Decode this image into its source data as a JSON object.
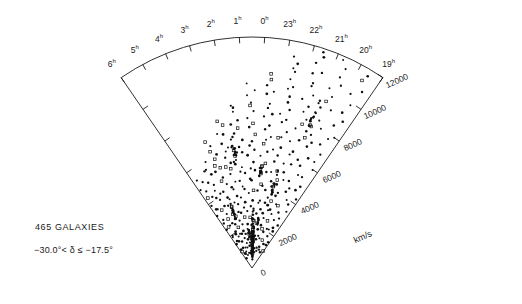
{
  "figure": {
    "kind": "redshift-cone-diagram",
    "annotations": {
      "count_label": "465 GALAXIES",
      "declination_range": "−30.0°< δ ≤ −17.5°",
      "velocity_axis_label": "km/s"
    },
    "geometry": {
      "apex_x": 252,
      "apex_y": 268,
      "radius": 231,
      "ra_start_hours": 19,
      "ra_end_hours": 30,
      "left_edge_angle_deg": 235.5,
      "right_edge_angle_deg": 304.5,
      "line_color": "#1a1a1a",
      "point_color": "#101010"
    },
    "ra_ticks": [
      {
        "label": "6",
        "unit": "h",
        "hour": 6
      },
      {
        "label": "5",
        "unit": "h",
        "hour": 5
      },
      {
        "label": "4",
        "unit": "h",
        "hour": 4
      },
      {
        "label": "3",
        "unit": "h",
        "hour": 3
      },
      {
        "label": "2",
        "unit": "h",
        "hour": 2
      },
      {
        "label": "1",
        "unit": "h",
        "hour": 1
      },
      {
        "label": "0",
        "unit": "h",
        "hour": 0
      },
      {
        "label": "23",
        "unit": "h",
        "hour": 23
      },
      {
        "label": "22",
        "unit": "h",
        "hour": 22
      },
      {
        "label": "21",
        "unit": "h",
        "hour": 21
      },
      {
        "label": "20",
        "unit": "h",
        "hour": 20
      },
      {
        "label": "19",
        "unit": "h",
        "hour": 19
      }
    ],
    "velocity_ticks": [
      {
        "label": "0",
        "value": 0
      },
      {
        "label": "2000",
        "value": 2000
      },
      {
        "label": "4000",
        "value": 4000
      },
      {
        "label": "6000",
        "value": 6000
      },
      {
        "label": "8000",
        "value": 8000
      },
      {
        "label": "10000",
        "value": 10000
      },
      {
        "label": "12000",
        "value": 12000
      }
    ]
  },
  "chart_data": {
    "type": "scatter",
    "title": "",
    "subtitle": "",
    "xlabel": "Right Ascension (hours)",
    "ylabel": "km/s",
    "projection": "polar-wedge",
    "grid": false,
    "legend": null,
    "n_points": 465,
    "r_range": [
      0,
      12000
    ],
    "theta_range_hours": [
      19,
      30
    ],
    "annotations": [
      "465 GALAXIES",
      "−30.0°< δ ≤ −17.5°"
    ],
    "points_rt": [
      [
        1120,
        19.3
      ],
      [
        1380,
        19.6
      ],
      [
        1650,
        19.4
      ],
      [
        2100,
        19.8
      ],
      [
        2460,
        19.5
      ],
      [
        2980,
        19.9
      ],
      [
        3350,
        19.45
      ],
      [
        3810,
        19.75
      ],
      [
        4180,
        19.35
      ],
      [
        4620,
        19.85
      ],
      [
        5020,
        19.55
      ],
      [
        5470,
        19.95
      ],
      [
        5910,
        19.4
      ],
      [
        6330,
        19.7
      ],
      [
        6780,
        19.5
      ],
      [
        7210,
        19.9
      ],
      [
        7660,
        19.6
      ],
      [
        8090,
        19.3
      ],
      [
        8540,
        19.8
      ],
      [
        8970,
        19.45
      ],
      [
        9410,
        19.7
      ],
      [
        9860,
        19.55
      ],
      [
        10310,
        19.85
      ],
      [
        10750,
        19.4
      ],
      [
        11180,
        19.65
      ],
      [
        11620,
        19.5
      ],
      [
        1020,
        20.2
      ],
      [
        1310,
        20.5
      ],
      [
        1720,
        20.35
      ],
      [
        2080,
        20.7
      ],
      [
        2390,
        20.15
      ],
      [
        2760,
        20.6
      ],
      [
        3140,
        20.4
      ],
      [
        3520,
        20.85
      ],
      [
        3880,
        20.25
      ],
      [
        4250,
        20.65
      ],
      [
        4610,
        20.45
      ],
      [
        5000,
        20.9
      ],
      [
        5360,
        20.3
      ],
      [
        5740,
        20.55
      ],
      [
        6110,
        20.8
      ],
      [
        6480,
        20.2
      ],
      [
        6860,
        20.6
      ],
      [
        7230,
        20.4
      ],
      [
        7600,
        20.75
      ],
      [
        7980,
        20.35
      ],
      [
        8350,
        20.55
      ],
      [
        8730,
        20.9
      ],
      [
        9100,
        20.25
      ],
      [
        9480,
        20.65
      ],
      [
        9850,
        20.45
      ],
      [
        10230,
        20.8
      ],
      [
        10600,
        20.3
      ],
      [
        10980,
        20.6
      ],
      [
        11350,
        20.5
      ],
      [
        11730,
        20.7
      ],
      [
        930,
        21.2
      ],
      [
        1250,
        21.5
      ],
      [
        1580,
        21.3
      ],
      [
        1910,
        21.7
      ],
      [
        2240,
        21.15
      ],
      [
        2570,
        21.6
      ],
      [
        2900,
        21.4
      ],
      [
        3230,
        21.8
      ],
      [
        3560,
        21.25
      ],
      [
        3890,
        21.65
      ],
      [
        4220,
        21.45
      ],
      [
        4550,
        21.9
      ],
      [
        4880,
        21.35
      ],
      [
        5210,
        21.55
      ],
      [
        5540,
        21.75
      ],
      [
        5870,
        21.2
      ],
      [
        6200,
        21.6
      ],
      [
        6530,
        21.4
      ],
      [
        6860,
        21.85
      ],
      [
        7190,
        21.3
      ],
      [
        7520,
        21.7
      ],
      [
        7850,
        21.5
      ],
      [
        8180,
        21.25
      ],
      [
        8510,
        21.65
      ],
      [
        8840,
        21.45
      ],
      [
        9170,
        21.8
      ],
      [
        9500,
        21.35
      ],
      [
        9830,
        21.6
      ],
      [
        10160,
        21.55
      ],
      [
        10490,
        21.75
      ],
      [
        10820,
        21.4
      ],
      [
        11150,
        21.7
      ],
      [
        11480,
        21.5
      ],
      [
        11810,
        21.6
      ],
      [
        880,
        22.2
      ],
      [
        1180,
        22.5
      ],
      [
        1470,
        22.3
      ],
      [
        1770,
        22.7
      ],
      [
        2060,
        22.15
      ],
      [
        2360,
        22.6
      ],
      [
        2650,
        22.4
      ],
      [
        2950,
        22.8
      ],
      [
        3240,
        22.25
      ],
      [
        3540,
        22.65
      ],
      [
        3830,
        22.45
      ],
      [
        4130,
        22.9
      ],
      [
        4420,
        22.35
      ],
      [
        4720,
        22.55
      ],
      [
        5010,
        22.75
      ],
      [
        5310,
        22.2
      ],
      [
        5600,
        22.6
      ],
      [
        5900,
        22.4
      ],
      [
        6190,
        22.85
      ],
      [
        6490,
        22.3
      ],
      [
        6780,
        22.7
      ],
      [
        7080,
        22.5
      ],
      [
        7370,
        22.25
      ],
      [
        7670,
        22.65
      ],
      [
        7960,
        22.45
      ],
      [
        8260,
        22.8
      ],
      [
        8550,
        22.35
      ],
      [
        8850,
        22.6
      ],
      [
        9140,
        22.55
      ],
      [
        9440,
        22.75
      ],
      [
        9730,
        22.4
      ],
      [
        10030,
        22.7
      ],
      [
        10320,
        22.5
      ],
      [
        10620,
        22.6
      ],
      [
        10910,
        22.45
      ],
      [
        11210,
        22.65
      ],
      [
        840,
        23.2
      ],
      [
        1120,
        23.5
      ],
      [
        1400,
        23.3
      ],
      [
        1680,
        23.7
      ],
      [
        1960,
        23.15
      ],
      [
        2240,
        23.6
      ],
      [
        2520,
        23.4
      ],
      [
        2800,
        23.8
      ],
      [
        3080,
        23.25
      ],
      [
        3360,
        23.65
      ],
      [
        3640,
        23.45
      ],
      [
        3920,
        23.9
      ],
      [
        4200,
        23.35
      ],
      [
        4480,
        23.55
      ],
      [
        4760,
        23.75
      ],
      [
        5040,
        23.2
      ],
      [
        5320,
        23.6
      ],
      [
        5600,
        23.4
      ],
      [
        5880,
        23.85
      ],
      [
        6160,
        23.3
      ],
      [
        6440,
        23.7
      ],
      [
        6720,
        23.5
      ],
      [
        7000,
        23.25
      ],
      [
        7280,
        23.65
      ],
      [
        7560,
        23.45
      ],
      [
        7840,
        23.8
      ],
      [
        8120,
        23.35
      ],
      [
        8400,
        23.6
      ],
      [
        8680,
        23.55
      ],
      [
        8960,
        23.75
      ],
      [
        9240,
        23.4
      ],
      [
        9520,
        23.7
      ],
      [
        9800,
        23.5
      ],
      [
        10080,
        23.6
      ],
      [
        800,
        24.2
      ],
      [
        1080,
        24.5
      ],
      [
        1360,
        24.3
      ],
      [
        1640,
        24.7
      ],
      [
        1920,
        24.15
      ],
      [
        2200,
        24.6
      ],
      [
        2480,
        24.4
      ],
      [
        2760,
        24.8
      ],
      [
        3040,
        24.25
      ],
      [
        3320,
        24.65
      ],
      [
        3600,
        24.45
      ],
      [
        3880,
        24.9
      ],
      [
        4160,
        24.35
      ],
      [
        4440,
        24.55
      ],
      [
        4720,
        24.75
      ],
      [
        5000,
        24.2
      ],
      [
        5280,
        24.6
      ],
      [
        5560,
        24.4
      ],
      [
        5840,
        24.85
      ],
      [
        6120,
        24.3
      ],
      [
        6400,
        24.7
      ],
      [
        6680,
        24.5
      ],
      [
        6960,
        24.25
      ],
      [
        7240,
        24.65
      ],
      [
        7520,
        24.45
      ],
      [
        7800,
        24.8
      ],
      [
        8080,
        24.35
      ],
      [
        8360,
        24.6
      ],
      [
        8640,
        24.55
      ],
      [
        8920,
        24.75
      ],
      [
        9200,
        24.4
      ],
      [
        9480,
        24.7
      ],
      [
        780,
        25.2
      ],
      [
        1050,
        25.5
      ],
      [
        1320,
        25.3
      ],
      [
        1590,
        25.7
      ],
      [
        1860,
        25.15
      ],
      [
        2130,
        25.6
      ],
      [
        2400,
        25.4
      ],
      [
        2670,
        25.8
      ],
      [
        2940,
        25.25
      ],
      [
        3210,
        25.65
      ],
      [
        3480,
        25.45
      ],
      [
        3750,
        25.9
      ],
      [
        4020,
        25.35
      ],
      [
        4290,
        25.55
      ],
      [
        4560,
        25.75
      ],
      [
        4830,
        25.2
      ],
      [
        5100,
        25.6
      ],
      [
        5370,
        25.4
      ],
      [
        5640,
        25.85
      ],
      [
        5910,
        25.3
      ],
      [
        6180,
        25.7
      ],
      [
        6450,
        25.5
      ],
      [
        6720,
        25.25
      ],
      [
        6990,
        25.65
      ],
      [
        7260,
        25.45
      ],
      [
        7530,
        25.8
      ],
      [
        7800,
        25.35
      ],
      [
        8070,
        25.6
      ],
      [
        8340,
        25.55
      ],
      [
        8610,
        25.75
      ],
      [
        760,
        26.2
      ],
      [
        1020,
        26.5
      ],
      [
        1280,
        26.3
      ],
      [
        1540,
        26.7
      ],
      [
        1800,
        26.15
      ],
      [
        2060,
        26.6
      ],
      [
        2320,
        26.4
      ],
      [
        2580,
        26.8
      ],
      [
        2840,
        26.25
      ],
      [
        3100,
        26.65
      ],
      [
        3360,
        26.45
      ],
      [
        3620,
        26.9
      ],
      [
        3880,
        26.35
      ],
      [
        4140,
        26.55
      ],
      [
        4400,
        26.75
      ],
      [
        4660,
        26.2
      ],
      [
        4920,
        26.6
      ],
      [
        5180,
        26.4
      ],
      [
        5440,
        26.85
      ],
      [
        5700,
        26.3
      ],
      [
        5960,
        26.7
      ],
      [
        6220,
        26.5
      ],
      [
        6480,
        26.25
      ],
      [
        6740,
        26.65
      ],
      [
        7000,
        26.45
      ],
      [
        7260,
        26.8
      ],
      [
        7520,
        26.35
      ],
      [
        7780,
        26.6
      ],
      [
        740,
        27.2
      ],
      [
        990,
        27.5
      ],
      [
        1240,
        27.3
      ],
      [
        1490,
        27.7
      ],
      [
        1740,
        27.15
      ],
      [
        1990,
        27.6
      ],
      [
        2240,
        27.4
      ],
      [
        2490,
        27.8
      ],
      [
        2740,
        27.25
      ],
      [
        2990,
        27.65
      ],
      [
        3240,
        27.45
      ],
      [
        3490,
        27.9
      ],
      [
        3740,
        27.35
      ],
      [
        3990,
        27.55
      ],
      [
        4240,
        27.75
      ],
      [
        4490,
        27.2
      ],
      [
        4740,
        27.6
      ],
      [
        4990,
        27.4
      ],
      [
        5240,
        27.85
      ],
      [
        5490,
        27.3
      ],
      [
        5740,
        27.7
      ],
      [
        5990,
        27.5
      ],
      [
        6240,
        27.25
      ],
      [
        6490,
        27.65
      ],
      [
        6740,
        27.45
      ],
      [
        6990,
        27.8
      ],
      [
        720,
        28.2
      ],
      [
        960,
        28.5
      ],
      [
        1200,
        28.3
      ],
      [
        1440,
        28.7
      ],
      [
        1680,
        28.15
      ],
      [
        1920,
        28.6
      ],
      [
        2160,
        28.4
      ],
      [
        2400,
        28.8
      ],
      [
        2640,
        28.25
      ],
      [
        2880,
        28.65
      ],
      [
        3120,
        28.45
      ],
      [
        3360,
        28.9
      ],
      [
        3600,
        28.35
      ],
      [
        3840,
        28.55
      ],
      [
        4080,
        28.75
      ],
      [
        4320,
        28.2
      ],
      [
        4560,
        28.6
      ],
      [
        4800,
        28.4
      ],
      [
        5040,
        28.85
      ],
      [
        5280,
        28.3
      ],
      [
        5520,
        28.7
      ],
      [
        5760,
        28.5
      ],
      [
        6000,
        28.25
      ],
      [
        700,
        29.2
      ],
      [
        930,
        29.5
      ],
      [
        1160,
        29.3
      ],
      [
        1390,
        29.7
      ],
      [
        1620,
        29.15
      ],
      [
        1850,
        29.6
      ],
      [
        2080,
        29.4
      ],
      [
        2310,
        29.8
      ],
      [
        2540,
        29.25
      ],
      [
        2770,
        29.65
      ],
      [
        3000,
        29.45
      ],
      [
        3230,
        29.9
      ],
      [
        3460,
        29.35
      ],
      [
        3690,
        29.55
      ],
      [
        3920,
        29.75
      ],
      [
        4150,
        29.2
      ],
      [
        4380,
        29.6
      ],
      [
        4610,
        29.4
      ],
      [
        4840,
        29.85
      ],
      [
        5070,
        29.3
      ],
      [
        5300,
        29.7
      ],
      [
        620,
        24.35
      ],
      [
        780,
        24.32
      ],
      [
        940,
        24.38
      ],
      [
        1100,
        24.3
      ],
      [
        1260,
        24.36
      ],
      [
        1420,
        24.33
      ],
      [
        1580,
        24.4
      ],
      [
        1740,
        24.28
      ],
      [
        1900,
        24.34
      ],
      [
        2060,
        24.31
      ],
      [
        2220,
        24.37
      ],
      [
        2380,
        24.29
      ],
      [
        2540,
        24.35
      ],
      [
        2700,
        24.32
      ],
      [
        2860,
        24.38
      ],
      [
        3020,
        24.3
      ],
      [
        560,
        24.1
      ],
      [
        700,
        24.14
      ],
      [
        840,
        24.08
      ],
      [
        980,
        24.16
      ],
      [
        1120,
        24.06
      ],
      [
        1260,
        24.18
      ],
      [
        1400,
        24.04
      ],
      [
        1540,
        24.2
      ],
      [
        1680,
        24.02
      ],
      [
        1820,
        24.22
      ],
      [
        1960,
        24.12
      ],
      [
        2100,
        24.15
      ],
      [
        2240,
        24.09
      ],
      [
        2380,
        24.17
      ],
      [
        3200,
        22.05
      ],
      [
        3420,
        22.12
      ],
      [
        3640,
        21.98
      ],
      [
        3860,
        22.08
      ],
      [
        4080,
        22.15
      ],
      [
        4300,
        22.02
      ],
      [
        4520,
        22.1
      ],
      [
        4740,
        21.95
      ],
      [
        4960,
        22.06
      ],
      [
        5180,
        22.13
      ],
      [
        5400,
        25.95
      ],
      [
        5620,
        26.02
      ],
      [
        5840,
        25.88
      ],
      [
        6060,
        25.98
      ],
      [
        6280,
        26.05
      ],
      [
        6500,
        25.92
      ],
      [
        6720,
        26.0
      ],
      [
        6940,
        25.85
      ],
      [
        2600,
        27.4
      ],
      [
        2780,
        27.48
      ],
      [
        2960,
        27.35
      ],
      [
        3140,
        27.44
      ],
      [
        3320,
        27.52
      ],
      [
        3500,
        27.38
      ],
      [
        7400,
        20.95
      ],
      [
        7620,
        21.02
      ],
      [
        7840,
        20.88
      ],
      [
        8060,
        20.98
      ],
      [
        8280,
        21.05
      ],
      [
        8500,
        20.92
      ],
      [
        8720,
        21.0
      ],
      [
        8940,
        20.86
      ],
      [
        9160,
        20.96
      ],
      [
        9380,
        21.03
      ]
    ],
    "finger_of_god": {
      "r_center": 1150,
      "theta_hours": 24.35,
      "r_spread": 1300,
      "n": 46
    },
    "note": "Polar wedge: radius = recession velocity (km/s), angle = right ascension (hours)."
  }
}
